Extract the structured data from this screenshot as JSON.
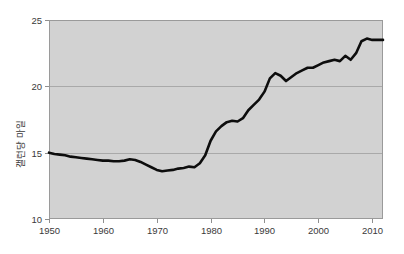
{
  "figure": {
    "background_color": "#ffffff",
    "plot_background_color": "#d2d2d2",
    "line_color": "#0d0d0d",
    "grid_color": "#a9a9a9",
    "axis_color": "#8f8f8f"
  },
  "chart_data": {
    "type": "line",
    "title": "",
    "xlabel": "",
    "ylabel": "갤런당 마일",
    "xlim": [
      1950,
      2012
    ],
    "ylim": [
      10,
      25
    ],
    "xticks": [
      1950,
      1960,
      1970,
      1980,
      1990,
      2000,
      2010
    ],
    "yticks": [
      10,
      15,
      20,
      25
    ],
    "xtick_labels": [
      "1950",
      "1960",
      "1970",
      "1980",
      "1990",
      "2000",
      "2010"
    ],
    "ytick_labels": [
      "10",
      "15",
      "20",
      "25"
    ],
    "grid": "horizontal gridlines at 15 and 20",
    "legend": "none",
    "series": [
      {
        "name": "갤런당 마일",
        "x": [
          1950,
          1951,
          1952,
          1953,
          1954,
          1955,
          1956,
          1957,
          1958,
          1959,
          1960,
          1961,
          1962,
          1963,
          1964,
          1965,
          1966,
          1967,
          1968,
          1969,
          1970,
          1971,
          1972,
          1973,
          1974,
          1975,
          1976,
          1977,
          1978,
          1979,
          1980,
          1981,
          1982,
          1983,
          1984,
          1985,
          1986,
          1987,
          1988,
          1989,
          1990,
          1991,
          1992,
          1993,
          1994,
          1995,
          1996,
          1997,
          1998,
          1999,
          2000,
          2001,
          2002,
          2003,
          2004,
          2005,
          2006,
          2007,
          2008,
          2009,
          2010,
          2011,
          2012
        ],
        "values": [
          15.0,
          14.9,
          14.85,
          14.8,
          14.7,
          14.65,
          14.6,
          14.55,
          14.5,
          14.45,
          14.4,
          14.4,
          14.35,
          14.35,
          14.4,
          14.5,
          14.45,
          14.3,
          14.1,
          13.9,
          13.7,
          13.6,
          13.65,
          13.7,
          13.8,
          13.85,
          13.95,
          13.9,
          14.2,
          14.8,
          15.9,
          16.6,
          17.0,
          17.3,
          17.4,
          17.35,
          17.6,
          18.2,
          18.6,
          19.0,
          19.6,
          20.6,
          21.0,
          20.8,
          20.4,
          20.7,
          21.0,
          21.2,
          21.4,
          21.4,
          21.6,
          21.8,
          21.9,
          22.0,
          21.9,
          22.3,
          22.0,
          22.5,
          23.4,
          23.6,
          23.5,
          23.5,
          23.5
        ]
      }
    ]
  },
  "axis": {
    "y_title": "갤런당 마일"
  }
}
